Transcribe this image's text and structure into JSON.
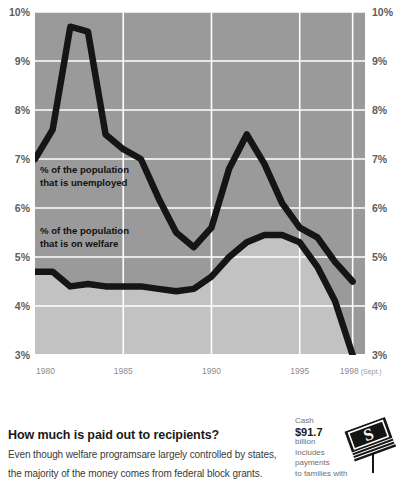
{
  "chart_data": {
    "type": "line",
    "title": "",
    "xlabel": "",
    "ylabel": "",
    "xlim": [
      1980,
      1998.7
    ],
    "ylim": [
      3,
      10
    ],
    "grid": true,
    "legend_position": "inline-annotation",
    "x_ticks": [
      "1980",
      "1985",
      "1990",
      "1995",
      "1998"
    ],
    "x_tick_values": [
      1980,
      1985,
      1990,
      1995,
      1998
    ],
    "x_tick_note": "(Sept.)",
    "y_ticks": [
      "3%",
      "4%",
      "5%",
      "6%",
      "7%",
      "8%",
      "9%",
      "10%"
    ],
    "y_tick_values": [
      3,
      4,
      5,
      6,
      7,
      8,
      9,
      10
    ],
    "y_axis_right_mirror": true,
    "series": [
      {
        "name": "% of the population that is unemployed",
        "annotation": "% of the population\nthat is unemployed",
        "annotation_line1": "% of the population",
        "annotation_line2": "that is unemployed",
        "x": [
          1980,
          1981,
          1982,
          1983,
          1984,
          1985,
          1986,
          1987,
          1988,
          1989,
          1990,
          1991,
          1992,
          1993,
          1994,
          1995,
          1996,
          1997,
          1998
        ],
        "values": [
          7.0,
          7.6,
          9.7,
          9.6,
          7.5,
          7.2,
          7.0,
          6.2,
          5.5,
          5.2,
          5.6,
          6.8,
          7.5,
          6.9,
          6.1,
          5.6,
          5.4,
          4.9,
          4.5
        ]
      },
      {
        "name": "% of the population that is on welfare",
        "annotation": "% of the population\nthat is on welfare",
        "annotation_line1": "% of the population",
        "annotation_line2": "that is on welfare",
        "x": [
          1980,
          1981,
          1982,
          1983,
          1984,
          1985,
          1986,
          1987,
          1988,
          1989,
          1990,
          1991,
          1992,
          1993,
          1994,
          1995,
          1996,
          1997,
          1998
        ],
        "values": [
          4.7,
          4.7,
          4.4,
          4.45,
          4.4,
          4.4,
          4.4,
          4.35,
          4.3,
          4.35,
          4.6,
          5.0,
          5.3,
          5.45,
          5.45,
          5.3,
          4.8,
          4.1,
          3.0
        ]
      }
    ],
    "colors": {
      "line": "#151515",
      "plot_background_upper": "#9a9a9a",
      "plot_background_lower": "#c2c2c2",
      "gridline": "#ffffff",
      "axis_text": "#5d5d5d"
    }
  },
  "footer": {
    "headline": "How much is paid out to recipients?",
    "body_line_1": "Even though welfare programsare largely  controlled by states,",
    "body_line_2": "the majority of the money comes from federal block grants.",
    "callout": {
      "label": "Cash",
      "amount": "$91.7",
      "unit": "billion",
      "description_line_1": "Includes payments",
      "description_line_2": "to families with"
    }
  }
}
